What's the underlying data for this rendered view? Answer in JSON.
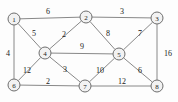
{
  "figure": {
    "kind": "weighted-undirected-graph",
    "background_color": "#fdfdfd",
    "node_fill_color": "#f2f2f2",
    "node_stroke_color": "#6e6e6e",
    "edge_color": "#888888",
    "text_color": "#1a1a1a"
  },
  "chart_data": {
    "type": "diagram",
    "title": "",
    "xlabel": "",
    "ylabel": "",
    "nodes": [
      {
        "id": "1",
        "label": "1",
        "x": 14,
        "y": 19
      },
      {
        "id": "2",
        "label": "2",
        "x": 86,
        "y": 17
      },
      {
        "id": "3",
        "label": "3",
        "x": 157,
        "y": 18
      },
      {
        "id": "4",
        "label": "4",
        "x": 45,
        "y": 53
      },
      {
        "id": "5",
        "label": "5",
        "x": 119,
        "y": 54
      },
      {
        "id": "6",
        "label": "6",
        "x": 14,
        "y": 85
      },
      {
        "id": "7",
        "label": "7",
        "x": 85,
        "y": 86
      },
      {
        "id": "8",
        "label": "8",
        "x": 157,
        "y": 86
      }
    ],
    "edges": [
      {
        "source": "1",
        "target": "2",
        "weight": "6",
        "lx": 48,
        "ly": 11
      },
      {
        "source": "2",
        "target": "3",
        "weight": "3",
        "lx": 122,
        "ly": 11
      },
      {
        "source": "1",
        "target": "4",
        "weight": "5",
        "lx": 34,
        "ly": 33
      },
      {
        "source": "2",
        "target": "4",
        "weight": "2",
        "lx": 64,
        "ly": 34
      },
      {
        "source": "2",
        "target": "5",
        "weight": "8",
        "lx": 108,
        "ly": 33
      },
      {
        "source": "3",
        "target": "5",
        "weight": "7",
        "lx": 140,
        "ly": 33
      },
      {
        "source": "1",
        "target": "6",
        "weight": "4",
        "lx": 8,
        "ly": 53
      },
      {
        "source": "3",
        "target": "8",
        "weight": "16",
        "lx": 168,
        "ly": 53
      },
      {
        "source": "4",
        "target": "5",
        "weight": "9",
        "lx": 82,
        "ly": 46
      },
      {
        "source": "4",
        "target": "6",
        "weight": "12",
        "lx": 27,
        "ly": 70
      },
      {
        "source": "4",
        "target": "7",
        "weight": "3",
        "lx": 65,
        "ly": 69
      },
      {
        "source": "5",
        "target": "7",
        "weight": "10",
        "lx": 100,
        "ly": 70
      },
      {
        "source": "5",
        "target": "8",
        "weight": "6",
        "lx": 140,
        "ly": 70
      },
      {
        "source": "6",
        "target": "7",
        "weight": "2",
        "lx": 48,
        "ly": 81
      },
      {
        "source": "7",
        "target": "8",
        "weight": "12",
        "lx": 122,
        "ly": 81
      }
    ]
  }
}
